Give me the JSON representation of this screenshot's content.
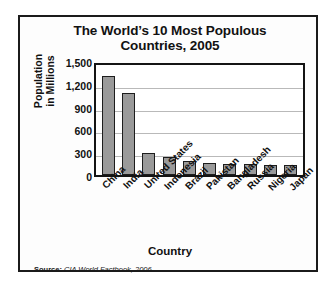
{
  "chart_data": {
    "type": "bar",
    "title_line1": "The World’s 10 Most Populous",
    "title_line2": "Countries, 2005",
    "categories": [
      "China",
      "India",
      "United States",
      "Indonesia",
      "Brazil",
      "Pakistan",
      "Bangladesh",
      "Russia",
      "Nigeria",
      "Japan"
    ],
    "values": [
      1306,
      1080,
      296,
      242,
      186,
      162,
      144,
      143,
      129,
      127
    ],
    "xlabel": "Country",
    "ylabel": "Population in Millions",
    "ylabel_line1": "Population",
    "ylabel_line2": "in Millions",
    "ylim": [
      0,
      1500
    ],
    "yticks": [
      0,
      300,
      600,
      900,
      1200,
      1500
    ],
    "ytick_labels": [
      "0",
      "300",
      "600",
      "900",
      "1,200",
      "1,500"
    ],
    "grid": true,
    "legend": "none",
    "bar_color": "#9a9a9a",
    "bar_border_color": "#1d1d1d",
    "gridline_color": "#b9b9b9",
    "axis_color": "#141414"
  },
  "source": {
    "label": "Source:",
    "text": "CIA World Factbook, 2006."
  }
}
